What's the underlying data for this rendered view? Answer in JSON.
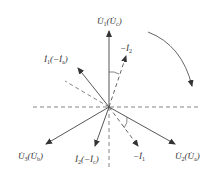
{
  "diagram": {
    "type": "phasor-diagram",
    "center": [
      109,
      107
    ],
    "colors": {
      "line": "#4a4a4a",
      "dashed": "#666666",
      "text": "#333333"
    },
    "phasors": [
      {
        "id": "U1",
        "label": "U̇₁ (U̇c)",
        "main": "U̇",
        "sub": "1",
        "alt_main": "U̇",
        "alt_sub": "c",
        "tip": [
          109,
          30
        ],
        "style": "solid"
      },
      {
        "id": "U2",
        "label": "U̇₂ (U̇a)",
        "main": "U̇",
        "sub": "2",
        "alt_main": "U̇",
        "alt_sub": "a",
        "tip": [
          176,
          145
        ],
        "style": "solid"
      },
      {
        "id": "U3",
        "label": "U̇₃ (U̇b)",
        "main": "U̇",
        "sub": "3",
        "alt_main": "U̇",
        "alt_sub": "b",
        "tip": [
          45,
          145
        ],
        "style": "solid"
      },
      {
        "id": "I1",
        "label": "İ₁ (−İa)",
        "main": "İ",
        "sub": "1",
        "alt_main": "−İ",
        "alt_sub": "a",
        "tip": [
          77,
          67
        ],
        "style": "solid"
      },
      {
        "id": "I2",
        "label": "İ₂ (−İc)",
        "main": "İ",
        "sub": "2",
        "alt_main": "−İ",
        "alt_sub": "c",
        "tip": [
          95,
          147
        ],
        "style": "solid"
      },
      {
        "id": "negI1",
        "label": "−İ₁",
        "main": "−İ",
        "sub": "1",
        "tip": [
          139,
          147
        ],
        "style": "dashed"
      },
      {
        "id": "negI2",
        "label": "−İ₂",
        "main": "−İ",
        "sub": "2",
        "tip": [
          127,
          55
        ],
        "style": "dashed"
      }
    ],
    "reference_lines": [
      {
        "from": [
          33,
          107
        ],
        "to": [
          199,
          107
        ],
        "style": "dashed",
        "name": "horizontal-axis"
      },
      {
        "from": [
          109,
          107
        ],
        "to": [
          109,
          168
        ],
        "style": "dashed",
        "name": "vertical-axis-lower"
      },
      {
        "from": [
          109,
          107
        ],
        "to": [
          65,
          81
        ],
        "style": "dashed",
        "name": "upper-left-reference"
      }
    ],
    "rotation_arrow": {
      "direction": "clockwise",
      "from": [
        148,
        32
      ],
      "to": [
        193,
        88
      ]
    },
    "angle_arcs": [
      {
        "between": [
          "U1",
          "negI2"
        ]
      },
      {
        "between": [
          "U2",
          "negI1"
        ]
      }
    ]
  }
}
